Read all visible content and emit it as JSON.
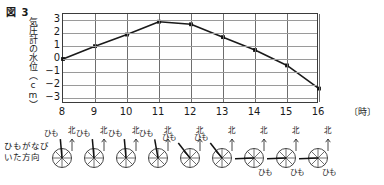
{
  "figure": {
    "title": "図 3"
  },
  "axes": {
    "ylabel": "気圧計の水位（cm）",
    "yticks": [
      "3",
      "2",
      "1",
      "0",
      "-1",
      "-2",
      "-3"
    ],
    "xticks": [
      "8",
      "9",
      "10",
      "11",
      "12",
      "13",
      "14",
      "15",
      "16"
    ],
    "xunit": "〔時〕"
  },
  "vane_section": {
    "label_line1": "ひもがなび",
    "label_line2": "いた方向",
    "north_label": "北",
    "string_label": "ひも"
  },
  "chart_data": {
    "type": "line",
    "title": "図 3",
    "xlabel": "〔時〕",
    "ylabel": "気圧計の水位（cm）",
    "x": [
      8,
      9,
      10,
      11,
      12,
      13,
      14,
      15,
      16
    ],
    "values": [
      0.0,
      1.0,
      1.9,
      2.9,
      2.7,
      1.7,
      0.7,
      -0.5,
      -2.3
    ],
    "categories": [
      "8",
      "9",
      "10",
      "11",
      "12",
      "13",
      "14",
      "15",
      "16"
    ],
    "xlim": [
      8,
      16
    ],
    "ylim": [
      -3.5,
      3.5
    ],
    "grid": true,
    "legend": "none",
    "markers": "filled-square",
    "series": [
      {
        "name": "気圧計の水位",
        "values": [
          0.0,
          1.0,
          1.9,
          2.9,
          2.7,
          1.7,
          0.7,
          -0.5,
          -2.3
        ]
      }
    ],
    "wind_vanes": [
      {
        "hour": "8",
        "string_angle_deg": 95,
        "north_label": "北",
        "string_label": "ひも",
        "string_label_pos": "upper-left"
      },
      {
        "hour": "9",
        "string_angle_deg": 95,
        "north_label": "北",
        "string_label": "ひも",
        "string_label_pos": "upper-left"
      },
      {
        "hour": "10",
        "string_angle_deg": 95,
        "north_label": "北",
        "string_label": "ひも",
        "string_label_pos": "upper-left"
      },
      {
        "hour": "11",
        "string_angle_deg": 100,
        "north_label": "北",
        "string_label": "ひも",
        "string_label_pos": "upper-left"
      },
      {
        "hour": "12",
        "string_angle_deg": 128,
        "north_label": "北",
        "string_label": "ひも",
        "string_label_pos": "upper-left"
      },
      {
        "hour": "13",
        "string_angle_deg": 128,
        "north_label": "北",
        "string_label": "ひも",
        "string_label_pos": "upper-left"
      },
      {
        "hour": "14",
        "string_angle_deg": 182,
        "north_label": "北",
        "string_label": "ひも",
        "string_label_pos": "lower-right"
      },
      {
        "hour": "15",
        "string_angle_deg": 182,
        "north_label": "北",
        "string_label": "ひも",
        "string_label_pos": "lower-right"
      },
      {
        "hour": "16",
        "string_angle_deg": 182,
        "north_label": "北",
        "string_label": "ひも",
        "string_label_pos": "lower-right"
      }
    ]
  }
}
